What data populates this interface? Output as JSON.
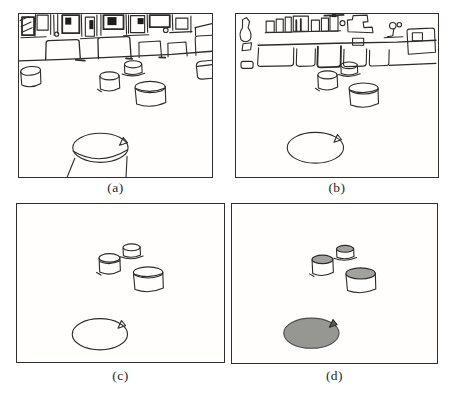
{
  "figure": {
    "panels": [
      {
        "id": "a",
        "label": "(a)"
      },
      {
        "id": "b",
        "label": "(b)"
      },
      {
        "id": "c",
        "label": "(c)"
      },
      {
        "id": "d",
        "label": "(d)"
      }
    ],
    "colors": {
      "ink": "#2b2b2b",
      "panel_border": "#2e2e2e",
      "background": "#ffffff",
      "highlight_region_fill": "#969692",
      "cylinder_cap_fill": "#a1a19d",
      "notch_fill": "#60584e"
    }
  }
}
